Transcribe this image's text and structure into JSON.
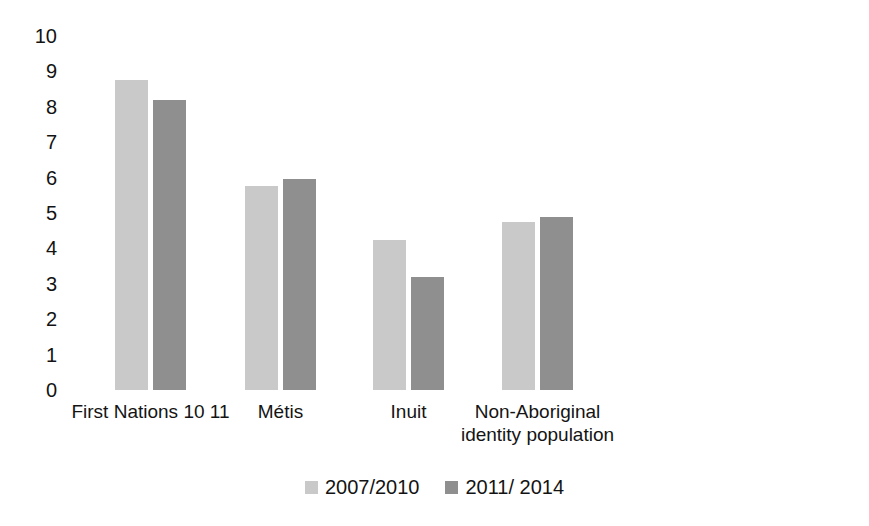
{
  "chart_data": {
    "type": "bar",
    "title": "",
    "subtitle": "",
    "xlabel": "",
    "ylabel": "",
    "ylim": [
      0,
      10
    ],
    "ytick_labels": [
      "10",
      "9",
      "8",
      "7",
      "6",
      "5",
      "4",
      "3",
      "2",
      "1",
      "0"
    ],
    "yticks": [
      10,
      9,
      8,
      7,
      6,
      5,
      4,
      3,
      2,
      1,
      0
    ],
    "grid": false,
    "legend_position": "bottom-center",
    "categories": [
      "First Nations 10 11",
      "Métis",
      "Inuit",
      "Non-Aboriginal\nidentity population"
    ],
    "series": [
      {
        "name": "2007/2010",
        "color": "#c9c9c9",
        "values": [
          8.75,
          5.75,
          4.25,
          4.75
        ]
      },
      {
        "name": "2011/ 2014",
        "color": "#8f8f8f",
        "values": [
          8.2,
          5.95,
          3.2,
          4.9
        ]
      }
    ]
  },
  "legend": {
    "items": [
      {
        "label": "2007/2010",
        "color": "#c9c9c9"
      },
      {
        "label": "2011/ 2014",
        "color": "#8f8f8f"
      }
    ]
  },
  "axes": {
    "y": {
      "labels": [
        "10",
        "9",
        "8",
        "7",
        "6",
        "5",
        "4",
        "3",
        "2",
        "1",
        "0"
      ]
    },
    "x": {
      "labels": [
        "First Nations 10 11",
        "Métis",
        "Inuit",
        "Non-Aboriginal\nidentity population"
      ]
    }
  },
  "colors": {
    "series_2007_2010": "#c9c9c9",
    "series_2011_2014": "#8f8f8f",
    "text": "#131313",
    "background": "#ffffff"
  }
}
